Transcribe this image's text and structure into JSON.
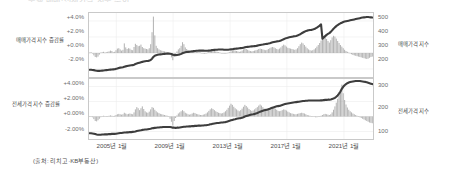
{
  "figure": {
    "clipped_title": "주택 매매·전세가격 지수 추이",
    "source_note": "(출처: 리치고·KB부동산)",
    "background": "#ffffff",
    "bar_color": "#a8a8a8",
    "line_color": "#3d3d3d",
    "axis_color": "#c9c9c9",
    "gridline_color": "#e2e2e2",
    "text_color": "#4f4f4f"
  },
  "chart_data": [
    {
      "type": "bar",
      "id": "sale-price-panel",
      "title": "",
      "xlabel": "",
      "ylabel": "매매가격 지수 증감률",
      "ylabel_right": "매매가격 지수",
      "grid": true,
      "legend": "none",
      "ylim": [
        -3.0,
        5.0
      ],
      "yticks": [
        "+4.0%",
        "+2.0%",
        "+0.0%",
        "-2.0%"
      ],
      "ytick_values": [
        4.0,
        2.0,
        0.0,
        -2.0
      ],
      "ylim_right": [
        150,
        560
      ],
      "yticks_right": [
        "500",
        "400",
        "300",
        "200"
      ],
      "ytick_values_right": [
        500,
        400,
        300,
        200
      ],
      "x": [
        "2005년 1월",
        "2009년 1월",
        "2013년 1월",
        "2017년 1월",
        "2021년 1월"
      ],
      "xlim": [
        "2003-01",
        "2022-09"
      ],
      "series": [
        {
          "name": "매매가격 지수 증감률",
          "type": "bar",
          "unit": "%",
          "values": [
            0.05,
            0.1,
            -0.05,
            -0.3,
            -0.5,
            -0.55,
            -0.45,
            -0.2,
            0.05,
            0.1,
            0.15,
            0.05,
            0.1,
            0.15,
            0.2,
            0.3,
            0.25,
            0.1,
            0.15,
            0.35,
            0.55,
            0.6,
            0.45,
            0.3,
            0.4,
            1.2,
            0.7,
            0.5,
            0.6,
            0.55,
            0.4,
            0.35,
            0.75,
            1.15,
            1.0,
            0.85,
            0.9,
            1.05,
            0.75,
            0.6,
            0.55,
            0.5,
            0.45,
            0.6,
            1.1,
            2.6,
            4.55,
            2.2,
            0.9,
            0.6,
            0.45,
            0.35,
            0.3,
            0.25,
            0.2,
            0.15,
            0.1,
            0.05,
            -0.2,
            -0.55,
            -0.9,
            -0.5,
            -0.1,
            0.2,
            0.45,
            0.6,
            0.9,
            1.35,
            1.1,
            0.7,
            0.5,
            0.35,
            0.3,
            0.25,
            0.3,
            0.35,
            0.3,
            0.2,
            0.15,
            0.1,
            0.05,
            0.0,
            -0.05,
            -0.1,
            -0.05,
            0.05,
            0.2,
            0.35,
            0.5,
            0.45,
            0.3,
            0.2,
            0.15,
            0.1,
            0.05,
            0.0,
            -0.05,
            -0.1,
            -0.05,
            0.0,
            0.05,
            0.1,
            0.2,
            0.3,
            0.35,
            0.3,
            0.25,
            0.2,
            0.15,
            0.2,
            0.3,
            0.45,
            0.55,
            0.5,
            0.4,
            0.3,
            0.25,
            0.2,
            0.25,
            0.3,
            0.35,
            0.4,
            0.5,
            0.55,
            0.5,
            0.45,
            0.4,
            0.35,
            0.4,
            0.5,
            0.6,
            0.7,
            0.75,
            0.7,
            0.6,
            0.5,
            0.45,
            0.55,
            0.7,
            0.9,
            1.05,
            0.95,
            0.8,
            0.65,
            0.6,
            0.55,
            0.5,
            0.45,
            0.4,
            0.45,
            0.6,
            0.85,
            1.1,
            1.3,
            1.2,
            1.0,
            0.8,
            0.6,
            0.45,
            0.35,
            0.3,
            0.35,
            0.45,
            0.6,
            0.8,
            1.0,
            1.25,
            1.55,
            1.85,
            2.05,
            1.95,
            1.75,
            1.5,
            1.3,
            1.6,
            1.95,
            2.15,
            2.05,
            1.8,
            1.5,
            1.25,
            1.0,
            0.8,
            0.6,
            0.4,
            0.25,
            0.15,
            0.05,
            -0.05,
            -0.15,
            -0.25,
            -0.3,
            -0.35,
            -0.4,
            -0.45,
            -0.5,
            -0.55,
            -0.6,
            -0.65,
            -0.7,
            -0.75,
            -0.7,
            -0.6,
            -0.5,
            -0.45
          ]
        },
        {
          "name": "매매가격 지수",
          "type": "line",
          "unit": "index",
          "values": [
            196,
            196,
            195,
            194,
            192,
            190,
            189,
            189,
            190,
            191,
            192,
            193,
            194,
            195,
            196,
            197,
            198,
            199,
            200,
            202,
            205,
            208,
            210,
            211,
            213,
            216,
            218,
            220,
            222,
            224,
            225,
            226,
            229,
            233,
            236,
            239,
            242,
            245,
            247,
            249,
            251,
            252,
            253,
            255,
            259,
            267,
            279,
            286,
            290,
            292,
            294,
            295,
            296,
            297,
            298,
            299,
            300,
            300,
            299,
            297,
            293,
            291,
            290,
            291,
            293,
            295,
            298,
            302,
            306,
            308,
            310,
            311,
            312,
            313,
            314,
            316,
            317,
            318,
            318,
            319,
            319,
            319,
            319,
            318,
            318,
            318,
            319,
            320,
            322,
            323,
            324,
            325,
            325,
            326,
            326,
            326,
            326,
            325,
            325,
            325,
            325,
            326,
            327,
            328,
            330,
            331,
            332,
            333,
            334,
            335,
            336,
            338,
            340,
            342,
            343,
            344,
            345,
            346,
            347,
            348,
            349,
            351,
            353,
            355,
            357,
            358,
            360,
            361,
            362,
            364,
            366,
            369,
            372,
            374,
            376,
            378,
            379,
            381,
            384,
            388,
            392,
            396,
            399,
            402,
            404,
            406,
            408,
            410,
            411,
            413,
            416,
            420,
            424,
            430,
            435,
            440,
            444,
            447,
            449,
            451,
            452,
            454,
            457,
            461,
            466,
            472,
            479,
            487,
            396,
            404,
            412,
            420,
            426,
            431,
            439,
            449,
            459,
            468,
            476,
            483,
            489,
            494,
            498,
            502,
            505,
            507,
            509,
            511,
            513,
            515,
            517,
            519,
            521,
            523,
            525,
            527,
            529,
            531,
            532,
            533,
            534,
            534,
            533,
            532,
            531
          ]
        }
      ]
    },
    {
      "type": "bar",
      "id": "jeonse-price-panel",
      "title": "",
      "xlabel": "",
      "ylabel": "전세가격 지수 증감률",
      "ylabel_right": "전세가격 지수",
      "grid": true,
      "legend": "none",
      "ylim": [
        -3.0,
        5.0
      ],
      "yticks": [
        "+4.00%",
        "+2.00%",
        "+0.00%",
        "-2.00%"
      ],
      "ytick_values": [
        4.0,
        2.0,
        0.0,
        -2.0
      ],
      "ylim_right": [
        70,
        340
      ],
      "yticks_right": [
        "300",
        "200",
        "100"
      ],
      "ytick_values_right": [
        300,
        200,
        100
      ],
      "x": [
        "2005년 1월",
        "2009년 1월",
        "2013년 1월",
        "2017년 1월",
        "2021년 1월"
      ],
      "xlim": [
        "2003-01",
        "2022-09"
      ],
      "series": [
        {
          "name": "전세가격 지수 증감률",
          "type": "bar",
          "unit": "%",
          "values": [
            0.05,
            0.0,
            -0.1,
            -0.35,
            -0.6,
            -0.65,
            -0.5,
            -0.3,
            -0.1,
            0.05,
            0.1,
            0.05,
            0.0,
            0.05,
            0.1,
            0.15,
            0.1,
            0.05,
            0.1,
            0.2,
            0.3,
            0.35,
            0.3,
            0.25,
            0.3,
            0.5,
            0.4,
            0.3,
            0.35,
            0.4,
            0.35,
            0.3,
            0.55,
            0.95,
            1.25,
            1.1,
            0.85,
            1.1,
            1.35,
            1.0,
            0.7,
            0.55,
            0.5,
            0.65,
            0.95,
            1.25,
            1.15,
            0.9,
            0.7,
            0.55,
            0.45,
            0.35,
            0.3,
            0.25,
            0.2,
            0.15,
            0.1,
            0.0,
            -0.3,
            -0.7,
            -1.2,
            -0.6,
            -0.2,
            0.15,
            0.4,
            0.55,
            0.7,
            0.85,
            0.7,
            0.5,
            0.4,
            0.3,
            0.25,
            0.3,
            0.4,
            0.5,
            0.45,
            0.35,
            0.3,
            0.25,
            0.2,
            0.2,
            0.25,
            0.3,
            0.4,
            0.55,
            0.75,
            0.95,
            1.1,
            1.0,
            0.85,
            0.7,
            0.6,
            0.5,
            0.45,
            0.4,
            0.45,
            0.55,
            0.7,
            0.9,
            1.15,
            1.45,
            1.7,
            1.55,
            1.3,
            1.1,
            0.95,
            0.8,
            0.7,
            0.85,
            1.05,
            1.3,
            1.55,
            1.4,
            1.2,
            1.0,
            0.85,
            0.75,
            0.8,
            0.95,
            1.1,
            1.25,
            1.45,
            1.6,
            1.45,
            1.25,
            1.05,
            0.9,
            0.85,
            0.9,
            1.05,
            1.2,
            1.3,
            1.2,
            1.05,
            0.9,
            0.75,
            0.7,
            0.75,
            0.85,
            0.95,
            0.9,
            0.8,
            0.65,
            0.55,
            0.45,
            0.4,
            0.35,
            0.3,
            0.3,
            0.35,
            0.4,
            0.45,
            0.5,
            0.45,
            0.4,
            0.3,
            0.2,
            0.15,
            0.1,
            0.05,
            0.0,
            -0.05,
            -0.1,
            -0.1,
            -0.05,
            0.0,
            0.1,
            0.2,
            0.3,
            0.35,
            0.3,
            0.25,
            0.2,
            0.3,
            0.55,
            0.9,
            1.35,
            1.85,
            2.35,
            2.9,
            3.55,
            4.25,
            3.1,
            2.2,
            1.6,
            1.2,
            0.9,
            0.7,
            0.55,
            0.4,
            0.3,
            0.2,
            0.1,
            0.0,
            -0.1,
            -0.2,
            -0.3,
            -0.4,
            -0.5,
            -0.6,
            -0.7,
            -0.8,
            -0.85,
            -0.9
          ]
        },
        {
          "name": "전세가격 지수",
          "type": "line",
          "unit": "index",
          "values": [
            96,
            96,
            95,
            94,
            92,
            90,
            89,
            89,
            89,
            90,
            90,
            91,
            91,
            91,
            92,
            92,
            93,
            93,
            93,
            94,
            95,
            96,
            97,
            97,
            98,
            99,
            99,
            100,
            100,
            101,
            101,
            102,
            103,
            104,
            106,
            107,
            108,
            109,
            111,
            112,
            113,
            113,
            114,
            115,
            116,
            118,
            119,
            120,
            121,
            122,
            122,
            123,
            123,
            124,
            124,
            124,
            124,
            124,
            124,
            123,
            121,
            121,
            120,
            121,
            121,
            122,
            123,
            124,
            125,
            125,
            126,
            126,
            127,
            127,
            128,
            128,
            129,
            129,
            130,
            130,
            130,
            131,
            131,
            132,
            132,
            133,
            134,
            136,
            137,
            139,
            140,
            141,
            142,
            142,
            143,
            144,
            144,
            145,
            146,
            148,
            150,
            152,
            154,
            156,
            158,
            159,
            161,
            162,
            163,
            164,
            166,
            168,
            171,
            173,
            175,
            177,
            179,
            180,
            181,
            183,
            185,
            187,
            190,
            193,
            195,
            197,
            199,
            201,
            202,
            204,
            206,
            209,
            211,
            213,
            215,
            217,
            218,
            219,
            221,
            223,
            225,
            227,
            229,
            230,
            231,
            232,
            233,
            234,
            235,
            236,
            237,
            238,
            239,
            240,
            241,
            241,
            242,
            242,
            243,
            243,
            243,
            243,
            243,
            243,
            243,
            243,
            243,
            244,
            244,
            245,
            246,
            246,
            247,
            247,
            248,
            250,
            252,
            255,
            260,
            266,
            274,
            284,
            296,
            305,
            312,
            317,
            321,
            324,
            326,
            328,
            329,
            330,
            331,
            331,
            331,
            331,
            330,
            329,
            328,
            327,
            325,
            323,
            321,
            319,
            317
          ]
        }
      ]
    }
  ]
}
